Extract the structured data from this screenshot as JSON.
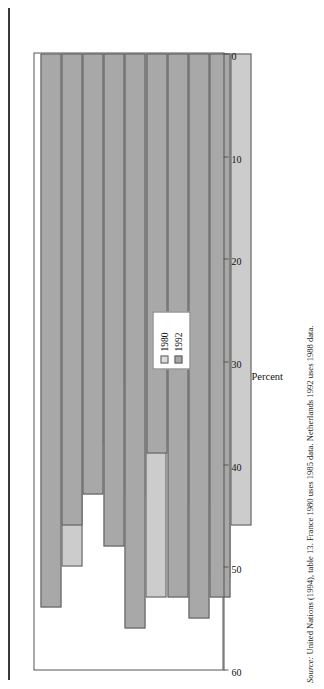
{
  "figure": {
    "orientation": "rotated-90-ccw",
    "percent_axis_title": "Percent",
    "source_prefix": "Source:",
    "source_text": " United Nations (1994), table 13. France 1980 uses 1985 data. Netherlands 1992 uses 1988 data."
  },
  "legend": {
    "entries": [
      {
        "label": "1980",
        "color": "#dcdcdc"
      },
      {
        "label": "1992",
        "color": "#a8a8a8"
      }
    ]
  },
  "chart_data": {
    "type": "bar",
    "orientation": "horizontal",
    "title": "",
    "xlabel": "Percent",
    "ylabel": "",
    "xlim": [
      0,
      60
    ],
    "xticks": [
      0,
      10,
      20,
      30,
      40,
      50,
      60
    ],
    "xticklabels": [
      "0",
      "10",
      "20",
      "30",
      "40",
      "50",
      "60"
    ],
    "grid": false,
    "legend_position": "inside-left",
    "categories": [
      "United States",
      "United Kingdom",
      "Netherlands",
      "Italy",
      "France",
      "Federal Republic\nof Germany",
      "Denmark",
      "Canada",
      "Australia"
    ],
    "series": [
      {
        "name": "1992",
        "color": "#a8a8a8",
        "values": [
          54,
          46,
          43,
          48,
          56,
          39,
          53,
          55,
          53
        ]
      },
      {
        "name": "1980",
        "color": "#cccccc",
        "values": [
          50,
          38,
          32,
          43,
          53,
          38,
          44,
          51,
          46
        ]
      }
    ],
    "annotations": [
      "France 1980 uses 1985 data.",
      "Netherlands 1992 uses 1988 data."
    ]
  }
}
